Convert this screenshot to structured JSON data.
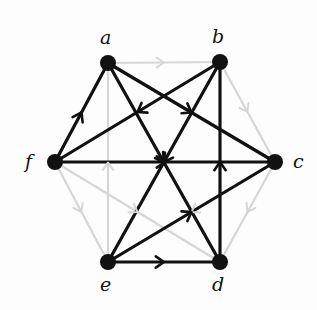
{
  "figure": {
    "type": "directed-graph",
    "background_color": "#fdfdfd",
    "dark_color": "#111111",
    "light_color": "#d6d6d6",
    "vertex_radius": 8,
    "canvas": {
      "width": 317,
      "height": 310
    }
  },
  "vertices": [
    {
      "id": "a",
      "label": "a",
      "x": 108,
      "y": 63,
      "label_x": 100,
      "label_y": 28
    },
    {
      "id": "b",
      "label": "b",
      "x": 220,
      "y": 62,
      "label_x": 212,
      "label_y": 27
    },
    {
      "id": "c",
      "label": "c",
      "x": 275,
      "y": 162,
      "label_x": 293,
      "label_y": 152
    },
    {
      "id": "d",
      "label": "d",
      "x": 220,
      "y": 262,
      "label_x": 212,
      "label_y": 275
    },
    {
      "id": "e",
      "label": "e",
      "x": 108,
      "y": 262,
      "label_x": 100,
      "label_y": 275
    },
    {
      "id": "f",
      "label": "f",
      "x": 55,
      "y": 162,
      "label_x": 25,
      "label_y": 152
    }
  ],
  "edges": [
    {
      "from": "a",
      "to": "b",
      "style": "light"
    },
    {
      "from": "b",
      "to": "c",
      "style": "light"
    },
    {
      "from": "c",
      "to": "d",
      "style": "light"
    },
    {
      "from": "f",
      "to": "e",
      "style": "light"
    },
    {
      "from": "e",
      "to": "a",
      "style": "light"
    },
    {
      "from": "f",
      "to": "d",
      "style": "light"
    },
    {
      "from": "c",
      "to": "e",
      "style": "light"
    },
    {
      "from": "f",
      "to": "a",
      "style": "dark"
    },
    {
      "from": "f",
      "to": "c",
      "style": "dark"
    },
    {
      "from": "e",
      "to": "d",
      "style": "dark"
    },
    {
      "from": "d",
      "to": "b",
      "style": "dark"
    },
    {
      "from": "a",
      "to": "c",
      "style": "dark"
    },
    {
      "from": "a",
      "to": "d",
      "style": "dark"
    },
    {
      "from": "b",
      "to": "e",
      "style": "dark"
    },
    {
      "from": "b",
      "to": "f",
      "style": "dark"
    },
    {
      "from": "e",
      "to": "c",
      "style": "dark"
    }
  ]
}
